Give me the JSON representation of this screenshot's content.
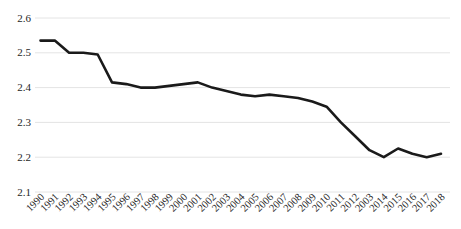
{
  "chart_data": {
    "type": "line",
    "title": "",
    "xlabel": "",
    "ylabel": "",
    "x": [
      1990,
      1991,
      1992,
      1993,
      1994,
      1995,
      1996,
      1997,
      1998,
      1999,
      2000,
      2001,
      2002,
      2003,
      2004,
      2005,
      2006,
      2007,
      2008,
      2009,
      2010,
      2011,
      2012,
      2013,
      2014,
      2015,
      2016,
      2017,
      2018
    ],
    "x_tick_labels": [
      "1990",
      "1991",
      "1992",
      "1993",
      "1994",
      "1995",
      "1996",
      "1997",
      "1998",
      "1999",
      "2000",
      "2001",
      "2002",
      "2003",
      "2004",
      "2005",
      "2006",
      "2007",
      "2008",
      "2009",
      "2010",
      "2011",
      "2012",
      "2003",
      "2014",
      "2015",
      "2016",
      "2017",
      "2018"
    ],
    "values": [
      2.535,
      2.535,
      2.5,
      2.5,
      2.495,
      2.415,
      2.41,
      2.4,
      2.4,
      2.405,
      2.41,
      2.415,
      2.4,
      2.39,
      2.38,
      2.375,
      2.38,
      2.375,
      2.37,
      2.36,
      2.345,
      2.3,
      2.26,
      2.22,
      2.2,
      2.225,
      2.21,
      2.2,
      2.21
    ],
    "ylim": [
      2.1,
      2.6
    ],
    "yticks": [
      2.1,
      2.2,
      2.3,
      2.4,
      2.5,
      2.6
    ],
    "ytick_labels": [
      "2.1",
      "2.2",
      "2.3",
      "2.4",
      "2.5",
      "2.6"
    ],
    "grid": true,
    "legend": false,
    "colors": {
      "line": "#1a1a1a",
      "grid": "#e4e4e4",
      "tick_text": "#262626",
      "background": "#ffffff"
    },
    "line_width": 2.6
  }
}
